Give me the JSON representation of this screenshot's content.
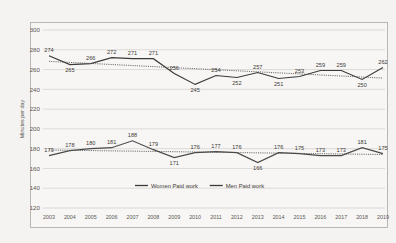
{
  "chart_data": {
    "type": "line",
    "title": "",
    "xlabel": "",
    "ylabel": "Minutes per day",
    "ylim": [
      120,
      300
    ],
    "yticks": [
      120,
      140,
      160,
      180,
      200,
      220,
      240,
      260,
      280,
      300
    ],
    "grid": true,
    "legend_position": "bottom",
    "categories": [
      "2003",
      "2004",
      "2005",
      "2006",
      "2007",
      "2008",
      "2009",
      "2010",
      "2011",
      "2012",
      "2013",
      "2014",
      "2015",
      "2016",
      "2017",
      "2018",
      "2019"
    ],
    "series": [
      {
        "name": "Women Paid work",
        "values": [
          274,
          265,
          266,
          272,
          271,
          271,
          256,
          245,
          254,
          252,
          257,
          251,
          253,
          259,
          259,
          250,
          262
        ],
        "trendline": true
      },
      {
        "name": "Men Paid work",
        "values": [
          173,
          178,
          180,
          181,
          188,
          179,
          171,
          176,
          177,
          176,
          166,
          176,
          175,
          173,
          173,
          181,
          175
        ],
        "trendline": true
      }
    ]
  },
  "legend": {
    "entries": [
      {
        "label": "Women Paid work"
      },
      {
        "label": "Men Paid work"
      }
    ]
  },
  "axes": {
    "y_title": "Minutes per day"
  }
}
